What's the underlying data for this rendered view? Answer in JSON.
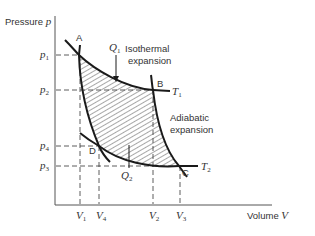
{
  "axes": {
    "y_label": "Pressure",
    "y_symbol": "p",
    "x_label": "Volume",
    "x_symbol": "V"
  },
  "points": {
    "A": "A",
    "B": "B",
    "C": "C",
    "D": "D"
  },
  "pressure_ticks": [
    {
      "base": "p",
      "sub": "1"
    },
    {
      "base": "p",
      "sub": "2"
    },
    {
      "base": "p",
      "sub": "4"
    },
    {
      "base": "p",
      "sub": "3"
    }
  ],
  "volume_ticks": [
    {
      "base": "V",
      "sub": "1"
    },
    {
      "base": "V",
      "sub": "4"
    },
    {
      "base": "V",
      "sub": "2"
    },
    {
      "base": "V",
      "sub": "3"
    }
  ],
  "temperatures": {
    "T1": {
      "base": "T",
      "sub": "1"
    },
    "T2": {
      "base": "T",
      "sub": "2"
    }
  },
  "heat": {
    "Q1": {
      "base": "Q",
      "sub": "1"
    },
    "Q2": {
      "base": "Q",
      "sub": "2"
    }
  },
  "annotations": {
    "isothermal_line1": "Isothermal",
    "isothermal_line2": "expansion",
    "adiabatic_line1": "Adiabatic",
    "adiabatic_line2": "expansion"
  },
  "colors": {
    "stroke": "#1a1a1a",
    "dash": "#333333",
    "text": "#333333"
  }
}
